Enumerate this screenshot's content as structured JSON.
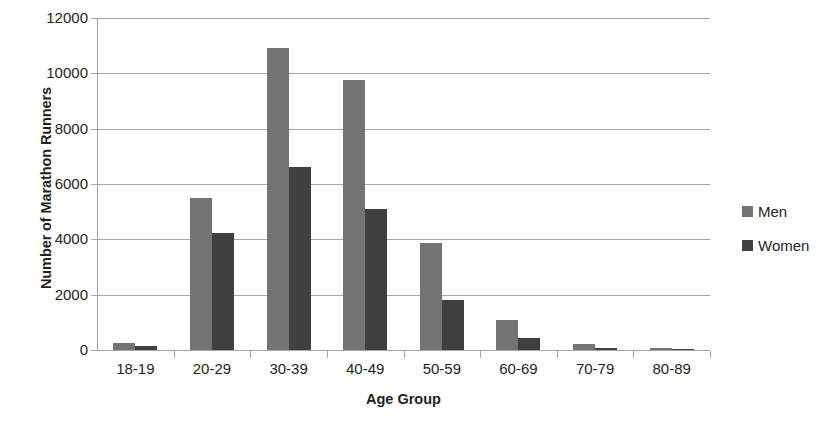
{
  "chart_data": {
    "type": "bar",
    "title": "",
    "xlabel": "Age Group",
    "ylabel": "Number of Marathon Runners",
    "categories": [
      "18-19",
      "20-29",
      "30-39",
      "40-49",
      "50-59",
      "60-69",
      "70-79",
      "80-89"
    ],
    "series": [
      {
        "name": "Men",
        "color": "#737373",
        "values": [
          260,
          5490,
          10900,
          9760,
          3880,
          1090,
          200,
          60
        ]
      },
      {
        "name": "Women",
        "color": "#404040",
        "values": [
          130,
          4240,
          6610,
          5100,
          1820,
          450,
          70,
          20
        ]
      }
    ],
    "ylim": [
      0,
      12000
    ],
    "yticks": [
      0,
      2000,
      4000,
      6000,
      8000,
      10000,
      12000
    ],
    "ytick_labels": [
      "0",
      "2000",
      "4000",
      "6000",
      "8000",
      "10000",
      "12000"
    ],
    "grid": true,
    "grid_axis": "y",
    "legend_position": "right",
    "bar_orientation": "vertical"
  },
  "legend": {
    "items": [
      {
        "label": "Men",
        "color": "#737373"
      },
      {
        "label": "Women",
        "color": "#404040"
      }
    ]
  },
  "colors": {
    "men": "#737373",
    "women": "#404040",
    "grid": "#a6a6a6",
    "text": "#231f20",
    "background": "#ffffff"
  }
}
